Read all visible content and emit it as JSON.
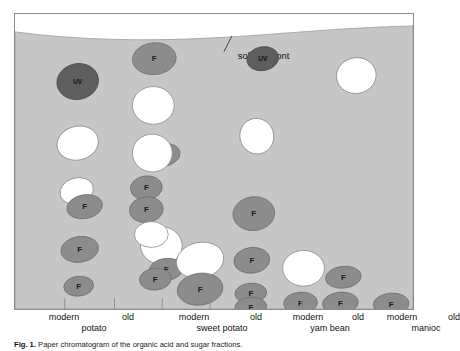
{
  "figure": {
    "caption_lead": "Fig. 1.",
    "caption_text": "Paper chromatogram of the organic acid and sugar fractions.",
    "panel_name": "paper-chromatogram-plate"
  },
  "annotations": {
    "solvent_front_label": "solvent front"
  },
  "colors": {
    "plate_background": "#c6c6c6",
    "above_front": "#ffffff",
    "spot_fluorescent": "#8c8c8c",
    "spot_fluorescent_stroke": "#6e6e6e",
    "spot_uv": "#5e5e5e",
    "spot_uv_stroke": "#4a4a4a",
    "spot_white": "#ffffff",
    "spot_white_stroke": "#8a8a8a",
    "panel_border": "#8a8a8a",
    "text": "#111111"
  },
  "axis": {
    "lanes": [
      {
        "id": "lane-modern-potato",
        "label": "modern",
        "x_pct": 14.0
      },
      {
        "id": "lane-old-potato",
        "label": "old",
        "x_pct": 30.5
      },
      {
        "id": "lane-modern-sweet-potato",
        "label": "modern",
        "x_pct": 46.5
      },
      {
        "id": "lane-old-sweet-potato",
        "label": "old",
        "x_pct": 62.0
      },
      {
        "id": "lane-modern-yam-bean",
        "label": "modern",
        "x_pct": 77.0
      },
      {
        "id": "lane-old-yam-bean",
        "label": "old",
        "x_pct": 91.0
      },
      {
        "id": "lane-modern-manioc",
        "label": "modern",
        "x_pct": 106.0
      },
      {
        "id": "lane-old-manioc",
        "label": "old",
        "x_pct": 120.0
      }
    ],
    "lanes_display": [
      {
        "label": "modern",
        "x_pct": 12.5
      },
      {
        "label": "old",
        "x_pct": 28.5
      },
      {
        "label": "modern",
        "x_pct": 45.0
      },
      {
        "label": "old",
        "x_pct": 60.5
      },
      {
        "label": "modern",
        "x_pct": 73.5
      },
      {
        "label": "old",
        "x_pct": 86.0
      },
      {
        "label": "modern",
        "x_pct": 97.0
      },
      {
        "label": "old",
        "x_pct": 110.0
      }
    ],
    "crops": [
      {
        "id": "crop-potato",
        "label": "potato",
        "x_pct": 20.0
      },
      {
        "id": "crop-sweet-potato",
        "label": "sweet potato",
        "x_pct": 52.0
      },
      {
        "id": "crop-yam-bean",
        "label": "yam bean",
        "x_pct": 79.0
      },
      {
        "id": "crop-manioc",
        "label": "manioc",
        "x_pct": 103.0
      }
    ]
  },
  "chart_data": {
    "type": "scatter",
    "title": "Paper chromatogram",
    "xlabel": "sample lane",
    "ylabel": "migration distance (Rf)",
    "grid": false,
    "legend": "none",
    "plate_width": 400,
    "plate_height": 297,
    "solvent_front_path": "M 0 18 C 60 26, 130 28, 200 24 C 262 21, 320 14, 400 12 L 400 297 L 0 297 Z",
    "solvent_front_leader": {
      "x1": 218,
      "y1": 22,
      "x2": 210,
      "y2": 38
    },
    "solvent_front_text_xy": {
      "x": 224,
      "y": 42
    },
    "spot_types": {
      "F": "fluorescent spot, mid-gray fill, labelled F",
      "UV": "UV-absorbing spot, dark gray fill, labelled UV",
      "W": "unlabelled white spot"
    },
    "categories": [
      "modern potato",
      "old potato",
      "modern sweet potato",
      "old sweet potato",
      "modern yam bean",
      "old yam bean",
      "modern manioc",
      "old manioc"
    ],
    "spots": [
      {
        "lane": "modern potato",
        "type": "UV",
        "label": "UV",
        "cx": 63,
        "cy": 68,
        "rx": 21,
        "ry": 18,
        "rot": -12
      },
      {
        "lane": "modern potato",
        "type": "W",
        "label": "",
        "cx": 63,
        "cy": 130,
        "rx": 21,
        "ry": 17,
        "rot": -14
      },
      {
        "lane": "modern potato",
        "type": "W",
        "label": "",
        "cx": 62,
        "cy": 178,
        "rx": 17,
        "ry": 13,
        "rot": -16
      },
      {
        "lane": "modern potato",
        "type": "F",
        "label": "F",
        "cx": 70,
        "cy": 194,
        "rx": 18,
        "ry": 12,
        "rot": -10
      },
      {
        "lane": "modern potato",
        "type": "F",
        "label": "F",
        "cx": 65,
        "cy": 237,
        "rx": 19,
        "ry": 13,
        "rot": -8
      },
      {
        "lane": "modern potato",
        "type": "F",
        "label": "F",
        "cx": 64,
        "cy": 274,
        "rx": 15,
        "ry": 10,
        "rot": -6
      },
      {
        "lane": "old potato",
        "type": "F",
        "label": "F",
        "cx": 147,
        "cy": 142,
        "rx": 19,
        "ry": 12,
        "rot": -8
      },
      {
        "lane": "old potato",
        "type": "W",
        "label": "",
        "cx": 147,
        "cy": 233,
        "rx": 21,
        "ry": 19,
        "rot": 5
      },
      {
        "lane": "old potato",
        "type": "F",
        "label": "F",
        "cx": 152,
        "cy": 257,
        "rx": 17,
        "ry": 11,
        "rot": -6
      },
      {
        "lane": "modern sweet potato",
        "type": "F",
        "label": "F",
        "cx": 140,
        "cy": 45,
        "rx": 22,
        "ry": 16,
        "rot": -5
      },
      {
        "lane": "modern sweet potato",
        "type": "W",
        "label": "",
        "cx": 139,
        "cy": 92,
        "rx": 21,
        "ry": 19,
        "rot": 0
      },
      {
        "lane": "modern sweet potato",
        "type": "W",
        "label": "",
        "cx": 138,
        "cy": 140,
        "rx": 20,
        "ry": 19,
        "rot": 0
      },
      {
        "lane": "modern sweet potato",
        "type": "F",
        "label": "F",
        "cx": 132,
        "cy": 175,
        "rx": 16,
        "ry": 12,
        "rot": -6
      },
      {
        "lane": "modern sweet potato",
        "type": "F",
        "label": "F",
        "cx": 132,
        "cy": 197,
        "rx": 17,
        "ry": 13,
        "rot": -6
      },
      {
        "lane": "modern sweet potato",
        "type": "W",
        "label": "",
        "cx": 137,
        "cy": 222,
        "rx": 17,
        "ry": 13,
        "rot": 0
      },
      {
        "lane": "modern sweet potato",
        "type": "F",
        "label": "F",
        "cx": 141,
        "cy": 267,
        "rx": 16,
        "ry": 11,
        "rot": -5
      },
      {
        "lane": "old sweet potato",
        "type": "W",
        "label": "",
        "cx": 186,
        "cy": 248,
        "rx": 24,
        "ry": 18,
        "rot": -12
      },
      {
        "lane": "old sweet potato",
        "type": "F",
        "label": "F",
        "cx": 186,
        "cy": 277,
        "rx": 23,
        "ry": 16,
        "rot": -8
      },
      {
        "lane": "modern yam bean",
        "type": "UV",
        "label": "UV",
        "cx": 249,
        "cy": 45,
        "rx": 16,
        "ry": 12,
        "rot": -10
      },
      {
        "lane": "modern yam bean",
        "type": "W",
        "label": "",
        "cx": 243,
        "cy": 123,
        "rx": 17,
        "ry": 18,
        "rot": -15
      },
      {
        "lane": "modern yam bean",
        "type": "F",
        "label": "F",
        "cx": 240,
        "cy": 201,
        "rx": 21,
        "ry": 17,
        "rot": -6
      },
      {
        "lane": "modern yam bean",
        "type": "F",
        "label": "F",
        "cx": 238,
        "cy": 248,
        "rx": 18,
        "ry": 13,
        "rot": -6
      },
      {
        "lane": "modern yam bean",
        "type": "F",
        "label": "F",
        "cx": 237,
        "cy": 281,
        "rx": 16,
        "ry": 10,
        "rot": -4
      },
      {
        "lane": "modern yam bean",
        "type": "F",
        "label": "F",
        "cx": 237,
        "cy": 295,
        "rx": 16,
        "ry": 10,
        "rot": -4
      },
      {
        "lane": "old yam bean",
        "type": "W",
        "label": "",
        "cx": 290,
        "cy": 256,
        "rx": 21,
        "ry": 18,
        "rot": 0
      },
      {
        "lane": "old yam bean",
        "type": "F",
        "label": "F",
        "cx": 287,
        "cy": 291,
        "rx": 17,
        "ry": 11,
        "rot": -4
      },
      {
        "lane": "modern manioc",
        "type": "F",
        "label": "F",
        "cx": 330,
        "cy": 265,
        "rx": 18,
        "ry": 11,
        "rot": -6
      },
      {
        "lane": "modern manioc",
        "type": "F",
        "label": "F",
        "cx": 327,
        "cy": 291,
        "rx": 18,
        "ry": 11,
        "rot": -5
      },
      {
        "lane": "old manioc",
        "type": "W",
        "label": "",
        "cx": 343,
        "cy": 62,
        "rx": 20,
        "ry": 18,
        "rot": -10
      },
      {
        "lane": "old manioc",
        "type": "F",
        "label": "F",
        "cx": 378,
        "cy": 292,
        "rx": 18,
        "ry": 11,
        "rot": -4
      }
    ],
    "baseline_ticks": [
      50,
      100,
      148,
      196,
      243,
      288,
      330,
      375
    ]
  }
}
